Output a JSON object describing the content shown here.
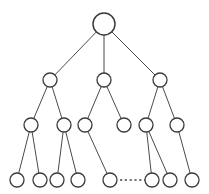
{
  "figure": {
    "clipped_caption_text": "——— —— —— ——— —— ————",
    "background_color": "#ffffff",
    "stroke_color": "#3a3a3a",
    "node_fill_color": "#ffffff",
    "edge_color": "#4a4a4a"
  },
  "chart_data": {
    "type": "diagram",
    "diagram_type": "tree",
    "levels": 4,
    "node_counts": [
      1,
      3,
      6,
      8
    ],
    "nodes": [
      {
        "id": "root",
        "level": 0,
        "x": 104,
        "y": 24,
        "r": 11,
        "label": ""
      },
      {
        "id": "n1",
        "level": 1,
        "x": 50,
        "y": 80,
        "r": 7,
        "label": ""
      },
      {
        "id": "n2",
        "level": 1,
        "x": 104,
        "y": 80,
        "r": 7,
        "label": ""
      },
      {
        "id": "n3",
        "level": 1,
        "x": 160,
        "y": 80,
        "r": 7,
        "label": ""
      },
      {
        "id": "m1",
        "level": 2,
        "x": 31,
        "y": 125,
        "r": 7,
        "label": ""
      },
      {
        "id": "m2",
        "level": 2,
        "x": 64,
        "y": 125,
        "r": 7,
        "label": ""
      },
      {
        "id": "m3",
        "level": 2,
        "x": 85,
        "y": 125,
        "r": 7,
        "label": ""
      },
      {
        "id": "m4",
        "level": 2,
        "x": 124,
        "y": 125,
        "r": 7,
        "label": ""
      },
      {
        "id": "m5",
        "level": 2,
        "x": 146,
        "y": 125,
        "r": 7,
        "label": ""
      },
      {
        "id": "m6",
        "level": 2,
        "x": 177,
        "y": 125,
        "r": 7,
        "label": ""
      },
      {
        "id": "l1",
        "level": 3,
        "x": 17,
        "y": 180,
        "r": 7,
        "label": ""
      },
      {
        "id": "l2",
        "level": 3,
        "x": 40,
        "y": 180,
        "r": 7,
        "label": ""
      },
      {
        "id": "l3",
        "level": 3,
        "x": 57,
        "y": 180,
        "r": 7,
        "label": ""
      },
      {
        "id": "l4",
        "level": 3,
        "x": 78,
        "y": 180,
        "r": 7,
        "label": ""
      },
      {
        "id": "l5",
        "level": 3,
        "x": 110,
        "y": 180,
        "r": 7,
        "label": ""
      },
      {
        "id": "l6",
        "level": 3,
        "x": 152,
        "y": 180,
        "r": 7,
        "label": ""
      },
      {
        "id": "l7",
        "level": 3,
        "x": 170,
        "y": 180,
        "r": 7,
        "label": ""
      },
      {
        "id": "l8",
        "level": 3,
        "x": 192,
        "y": 180,
        "r": 7,
        "label": ""
      }
    ],
    "edges": [
      {
        "from": "root",
        "to": "n1"
      },
      {
        "from": "root",
        "to": "n2"
      },
      {
        "from": "root",
        "to": "n3"
      },
      {
        "from": "n1",
        "to": "m1"
      },
      {
        "from": "n1",
        "to": "m2"
      },
      {
        "from": "n2",
        "to": "m3"
      },
      {
        "from": "n2",
        "to": "m4"
      },
      {
        "from": "n3",
        "to": "m5"
      },
      {
        "from": "n3",
        "to": "m6"
      },
      {
        "from": "m1",
        "to": "l1"
      },
      {
        "from": "m1",
        "to": "l2"
      },
      {
        "from": "m2",
        "to": "l3"
      },
      {
        "from": "m2",
        "to": "l4"
      },
      {
        "from": "m3",
        "to": "l5"
      },
      {
        "from": "m5",
        "to": "l6"
      },
      {
        "from": "m5",
        "to": "l7"
      },
      {
        "from": "m6",
        "to": "l8"
      }
    ],
    "ellipsis": {
      "label": "...",
      "style": "dashed",
      "x1": 120,
      "x2": 145,
      "y": 180,
      "meaning": "elided sibling leaf nodes"
    }
  }
}
